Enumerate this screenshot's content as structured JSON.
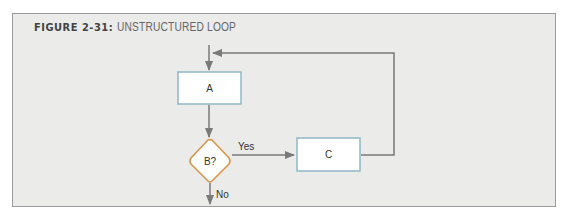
{
  "figure": {
    "number_label": "FIGURE 2-31:",
    "caption": "UNSTRUCTURED LOOP"
  },
  "diagram": {
    "nodes": [
      {
        "id": "A",
        "type": "process",
        "label": "A"
      },
      {
        "id": "B",
        "type": "decision",
        "label": "B?"
      },
      {
        "id": "C",
        "type": "process",
        "label": "C"
      }
    ],
    "edges": [
      {
        "from": "start",
        "to": "A",
        "label": ""
      },
      {
        "from": "A",
        "to": "B",
        "label": ""
      },
      {
        "from": "B",
        "to": "C",
        "label": "Yes"
      },
      {
        "from": "C",
        "to": "A",
        "label": ""
      },
      {
        "from": "B",
        "to": "end",
        "label": "No"
      }
    ],
    "colors": {
      "background": "#ebebea",
      "box_fill": "#ffffff",
      "box_border": "#8fb8c8",
      "decision_border": "#d9964a",
      "line": "#7a7a7a"
    }
  }
}
